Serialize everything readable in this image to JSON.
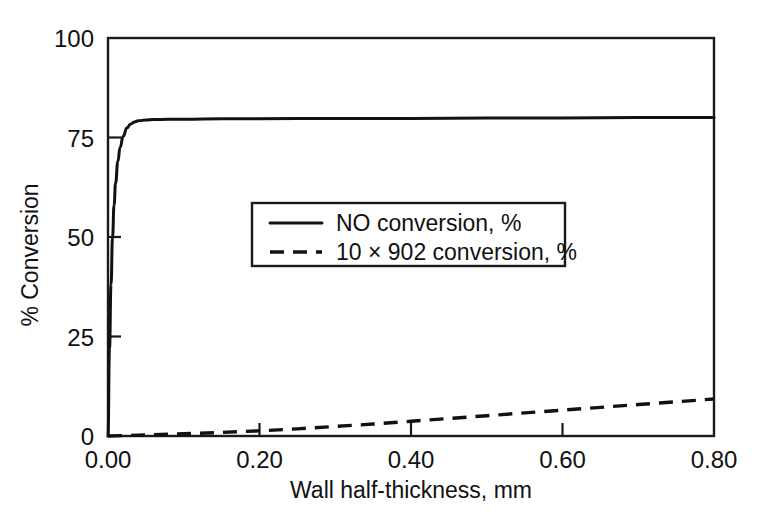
{
  "chart_data": {
    "type": "line",
    "title": "",
    "xlabel": "Wall half-thickness, mm",
    "ylabel": "% Conversion",
    "xlim": [
      0.0,
      0.8
    ],
    "ylim": [
      0,
      100
    ],
    "xticks": [
      "0.00",
      "0.20",
      "0.40",
      "0.60",
      "0.80"
    ],
    "xtick_values": [
      0.0,
      0.2,
      0.4,
      0.6,
      0.8
    ],
    "yticks": [
      "0",
      "25",
      "50",
      "75",
      "100"
    ],
    "ytick_values": [
      0,
      25,
      50,
      75,
      100
    ],
    "grid": false,
    "legend_position": "center",
    "series": [
      {
        "name": "NO conversion, %",
        "style": "solid",
        "x": [
          0.0,
          0.002,
          0.004,
          0.006,
          0.008,
          0.01,
          0.013,
          0.016,
          0.02,
          0.025,
          0.03,
          0.035,
          0.04,
          0.05,
          0.06,
          0.08,
          0.1,
          0.15,
          0.2,
          0.3,
          0.4,
          0.5,
          0.6,
          0.7,
          0.8
        ],
        "y": [
          0.0,
          22.0,
          38.0,
          50.0,
          58.0,
          63.5,
          69.0,
          72.5,
          75.3,
          77.4,
          78.4,
          78.9,
          79.2,
          79.4,
          79.5,
          79.6,
          79.6,
          79.7,
          79.7,
          79.8,
          79.8,
          79.9,
          79.9,
          80.0,
          80.0
        ]
      },
      {
        "name": "10 × 902 conversion, %",
        "style": "dashed",
        "x": [
          0.0,
          0.05,
          0.1,
          0.15,
          0.2,
          0.25,
          0.3,
          0.35,
          0.4,
          0.45,
          0.5,
          0.55,
          0.6,
          0.65,
          0.7,
          0.75,
          0.8
        ],
        "y": [
          0.0,
          0.25,
          0.55,
          0.9,
          1.3,
          1.8,
          2.4,
          3.0,
          3.7,
          4.4,
          5.1,
          5.8,
          6.5,
          7.2,
          7.9,
          8.6,
          9.3
        ]
      }
    ],
    "legend_entries": [
      {
        "label": "NO conversion, %",
        "style": "solid"
      },
      {
        "label": "10 × 902 conversion, %",
        "style": "dashed"
      }
    ]
  }
}
